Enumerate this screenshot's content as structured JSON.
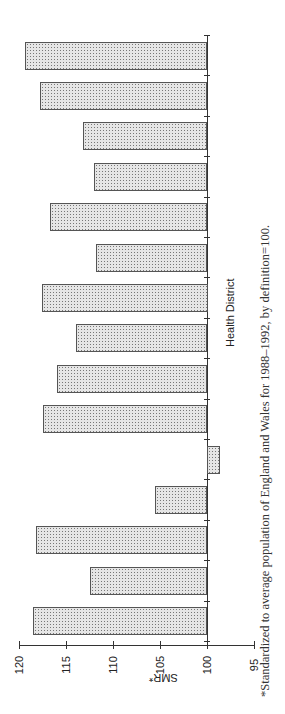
{
  "chart_data": {
    "type": "bar",
    "orientation": "rotated 90° counter-clockwise (vertical bars rendered horizontally)",
    "title": "",
    "xlabel": "Health District",
    "ylabel": "SMR*",
    "ylim": [
      95,
      120
    ],
    "yticks": [
      120,
      115,
      110,
      105,
      100,
      95
    ],
    "baseline": 100,
    "categories": [
      "1",
      "2",
      "3",
      "4",
      "5",
      "6",
      "7",
      "8",
      "9",
      "10",
      "11",
      "12",
      "13",
      "14",
      "15"
    ],
    "values": [
      118.5,
      112.4,
      118.1,
      105.5,
      98.7,
      117.4,
      115.9,
      113.9,
      117.5,
      111.8,
      116.6,
      112.0,
      113.1,
      117.7,
      119.3
    ],
    "grid": false,
    "legend": null,
    "footnote": "*Standardized to average population of England and Wales for 1988–1992, by definition=100."
  },
  "labels": {
    "x_axis": "Health District",
    "y_axis": "SMR*",
    "footnote": "*Standardized to average population of England and Wales for 1988–1992, by definition=100.",
    "ticks": [
      "120",
      "115",
      "110",
      "105",
      "100",
      "95"
    ]
  }
}
